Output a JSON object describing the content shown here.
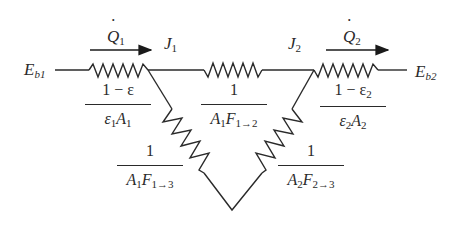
{
  "diagram": {
    "type": "radiation-network-circuit",
    "nodes": {
      "eb1": {
        "symbol": "E",
        "sub": "b1"
      },
      "j1": {
        "symbol": "J",
        "sub": "1"
      },
      "j2": {
        "symbol": "J",
        "sub": "2"
      },
      "eb2": {
        "symbol": "E",
        "sub": "b2"
      }
    },
    "heat_flows": {
      "q1": {
        "symbol": "Q",
        "sub": "1",
        "direction": "right"
      },
      "q2": {
        "symbol": "Q",
        "sub": "2",
        "direction": "right"
      }
    },
    "resistors": {
      "surface1": {
        "numerator": "1 − ε",
        "den_a": "ε",
        "den_a_sub": "1",
        "den_b": "A",
        "den_b_sub": "1"
      },
      "space12": {
        "numerator": "1",
        "den_a": "A",
        "den_a_sub": "1",
        "den_b": "F",
        "den_b_sub": "1→2"
      },
      "surface2": {
        "numerator": "1 − ε",
        "numerator_sub": "2",
        "den_a": "ε",
        "den_a_sub": "2",
        "den_b": "A",
        "den_b_sub": "2"
      },
      "space13": {
        "numerator": "1",
        "den_a": "A",
        "den_a_sub": "1",
        "den_b": "F",
        "den_b_sub": "1→3"
      },
      "space23": {
        "numerator": "1",
        "den_a": "A",
        "den_a_sub": "2",
        "den_b": "F",
        "den_b_sub": "2→3"
      }
    },
    "colors": {
      "ink": "#2a2a2a",
      "background": "#ffffff"
    }
  }
}
